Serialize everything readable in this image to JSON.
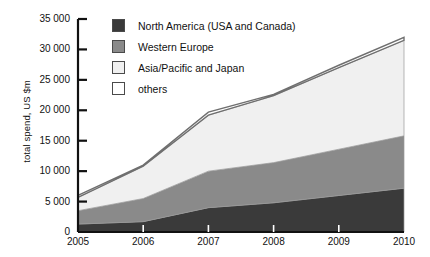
{
  "chart_data": {
    "type": "area",
    "stacked": true,
    "title": "",
    "xlabel": "",
    "ylabel": "total spend, US $m",
    "x": [
      2005,
      2006,
      2007,
      2008,
      2009,
      2010
    ],
    "categories": [
      "2005",
      "2006",
      "2007",
      "2008",
      "2009",
      "2010"
    ],
    "xlim": [
      2005,
      2010
    ],
    "ylim": [
      0,
      35000
    ],
    "yticks": [
      0,
      5000,
      10000,
      15000,
      20000,
      25000,
      30000,
      35000
    ],
    "ytick_labels": [
      "0",
      "5 000",
      "10 000",
      "15 000",
      "20 000",
      "25 000",
      "30 000",
      "35 000"
    ],
    "xticks": [
      2005,
      2006,
      2007,
      2008,
      2009,
      2010
    ],
    "xtick_labels": [
      "2005",
      "2006",
      "2007",
      "2008",
      "2009",
      "2010"
    ],
    "grid": false,
    "legend_position": "top-left-inside",
    "series": [
      {
        "name": "North America (USA and Canada)",
        "color": "#3a3a3a",
        "values": [
          1300,
          1700,
          4000,
          4800,
          6000,
          7200
        ]
      },
      {
        "name": "Western Europe",
        "color": "#8a8a8a",
        "values": [
          2200,
          3800,
          6000,
          6600,
          7600,
          8600
        ]
      },
      {
        "name": "Asia/Pacific and Japan",
        "color": "#f0f0f0",
        "values": [
          2200,
          5300,
          9200,
          11000,
          13400,
          15700
        ]
      },
      {
        "name": "others",
        "color": "#ffffff",
        "values": [
          300,
          200,
          500,
          200,
          400,
          500
        ]
      }
    ],
    "series_totals": [
      6000,
      11000,
      19700,
      22600,
      27400,
      32000
    ]
  },
  "legend": {
    "items": [
      {
        "label": "North America (USA and Canada)",
        "color": "#3a3a3a"
      },
      {
        "label": "Western Europe",
        "color": "#8a8a8a"
      },
      {
        "label": "Asia/Pacific and Japan",
        "color": "#f0f0f0"
      },
      {
        "label": "others",
        "color": "#ffffff"
      }
    ]
  },
  "axes": {
    "y_title": "total spend, US $m"
  }
}
